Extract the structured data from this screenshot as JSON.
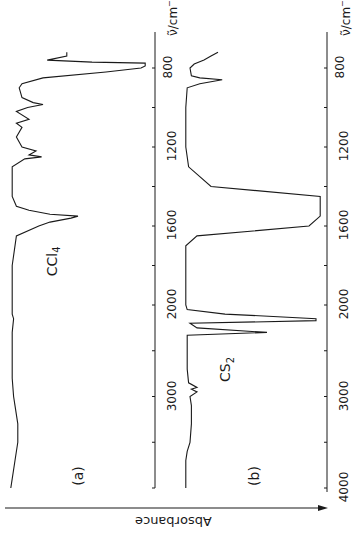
{
  "chart_data": [
    {
      "type": "line",
      "panel": "(a)",
      "compound": "CCl4",
      "title": "",
      "xlabel": "ν̃/cm⁻¹",
      "ylabel": "Absorbance",
      "xlim": [
        4000,
        700
      ],
      "x_ticks": [
        4000,
        3500,
        3000,
        2500,
        2000,
        1800,
        1600,
        1400,
        1200,
        1000,
        800
      ],
      "x_tick_labels": [
        "3000",
        "2000",
        "1600",
        "1200",
        "800"
      ],
      "orientation": "rotated 90°; wavenumber axis vertical, absorbance increasing to the right",
      "series": [
        {
          "name": "CCl4",
          "x": [
            4000,
            3900,
            3700,
            3500,
            3300,
            3100,
            3000,
            2800,
            2500,
            2300,
            2150,
            2100,
            2000,
            1800,
            1650,
            1600,
            1580,
            1560,
            1550,
            1540,
            1520,
            1500,
            1450,
            1300,
            1260,
            1250,
            1240,
            1220,
            1200,
            1150,
            1100,
            1080,
            1060,
            1020,
            1000,
            985,
            975,
            950,
            900,
            880,
            850,
            820,
            800,
            790,
            775,
            770,
            760,
            740,
            720
          ],
          "y": [
            0.02,
            0.03,
            0.05,
            0.07,
            0.07,
            0.05,
            0.04,
            0.03,
            0.03,
            0.03,
            0.04,
            0.03,
            0.03,
            0.03,
            0.06,
            0.22,
            0.3,
            0.45,
            0.5,
            0.3,
            0.15,
            0.06,
            0.03,
            0.03,
            0.12,
            0.24,
            0.15,
            0.2,
            0.1,
            0.06,
            0.1,
            0.06,
            0.15,
            0.06,
            0.14,
            0.25,
            0.18,
            0.1,
            0.08,
            0.1,
            0.25,
            0.7,
            0.95,
            0.98,
            0.98,
            0.6,
            0.28,
            0.42,
            0.42
          ]
        }
      ]
    },
    {
      "type": "line",
      "panel": "(b)",
      "compound": "CS2",
      "title": "",
      "xlabel": "ν̃/cm⁻¹",
      "ylabel": "Absorbance",
      "xlim": [
        4000,
        700
      ],
      "x_ticks": [
        4000,
        3500,
        3000,
        2500,
        2000,
        1800,
        1600,
        1400,
        1200,
        1000,
        800
      ],
      "x_tick_labels": [
        "4000",
        "3000",
        "2000",
        "1600",
        "1200",
        "800"
      ],
      "series": [
        {
          "name": "CS2",
          "x": [
            4000,
            3700,
            3600,
            3500,
            3300,
            3100,
            3000,
            2950,
            2920,
            2900,
            2850,
            2700,
            2400,
            2330,
            2300,
            2250,
            2200,
            2170,
            2150,
            2100,
            2050,
            2000,
            1900,
            1700,
            1650,
            1600,
            1550,
            1500,
            1450,
            1400,
            1300,
            1200,
            1100,
            1000,
            900,
            880,
            860,
            850,
            840,
            800,
            780,
            760,
            740,
            720
          ],
          "y": [
            0.02,
            0.02,
            0.03,
            0.05,
            0.06,
            0.06,
            0.05,
            0.1,
            0.06,
            0.1,
            0.04,
            0.03,
            0.03,
            0.03,
            0.6,
            0.1,
            0.05,
            0.95,
            0.95,
            0.3,
            0.03,
            0.02,
            0.02,
            0.02,
            0.1,
            0.9,
            0.98,
            0.98,
            0.98,
            0.2,
            0.04,
            0.02,
            0.02,
            0.02,
            0.03,
            0.12,
            0.28,
            0.12,
            0.06,
            0.05,
            0.08,
            0.15,
            0.2,
            0.25
          ]
        }
      ]
    }
  ],
  "labels": {
    "panel_a": "(a)",
    "panel_b": "(b)",
    "compound_a": "CCl",
    "compound_a_sub": "4",
    "compound_b": "CS",
    "compound_b_sub": "2",
    "axis_unit": "ν̃/cm",
    "axis_unit_sup": "−1",
    "absorbance": "Absorbance",
    "ticks_a": [
      "800",
      "1200",
      "1600",
      "2000",
      "3000"
    ],
    "ticks_b": [
      "800",
      "1200",
      "1600",
      "2000",
      "3000",
      "4000"
    ]
  },
  "colors": {
    "ink": "#1a1a1a",
    "background": "#ffffff"
  }
}
